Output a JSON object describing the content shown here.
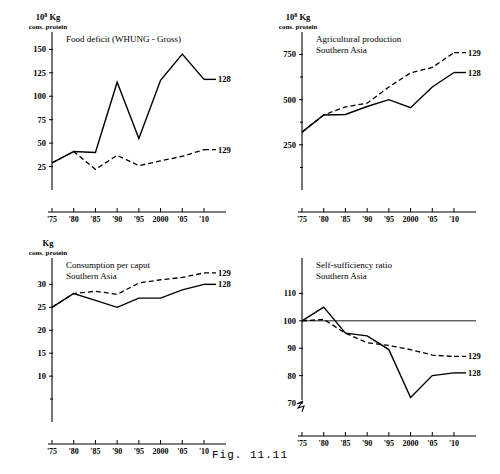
{
  "figure": {
    "caption": "Fig. 11.11"
  },
  "chart_data": [
    {
      "id": "food-deficit",
      "position": "top-left",
      "type": "line",
      "title": "Food deficit (WHUNG - Gross)",
      "subtitle": "",
      "ylabel_main": "Kg",
      "ylabel_exponent": "8",
      "ylabel_prefix": "10",
      "ylabel_sub": "cons. protein",
      "xlabel": "",
      "x": [
        "'75",
        "'80",
        "'85",
        "'90",
        "'95",
        "2000",
        "'05",
        "'10"
      ],
      "xtick_labels": [
        "'75",
        "'80",
        "'85",
        "'90",
        "'95",
        "2000",
        "'05",
        "'10"
      ],
      "ytick_labels": [
        "25",
        "50",
        "75",
        "100",
        "125",
        "150"
      ],
      "yticks": [
        25,
        50,
        75,
        100,
        125,
        150
      ],
      "yminor": [],
      "ylim": [
        0,
        160
      ],
      "grid": false,
      "reference_line": null,
      "axis_break": false,
      "series": [
        {
          "name": "128",
          "style": "solid",
          "label": "128",
          "values": [
            29,
            41,
            40,
            115,
            55,
            117,
            145,
            118
          ]
        },
        {
          "name": "129",
          "style": "dashed",
          "label": "129",
          "values": [
            29,
            41,
            22,
            37,
            26,
            31,
            36,
            43
          ]
        }
      ]
    },
    {
      "id": "agricultural-production",
      "position": "top-right",
      "type": "line",
      "title": "Agricultural production",
      "subtitle": "Southern Asia",
      "ylabel_main": "Kg",
      "ylabel_exponent": "8",
      "ylabel_prefix": "10",
      "ylabel_sub": "cons. protein",
      "xlabel": "",
      "x": [
        "'75",
        "'80",
        "'85",
        "'90",
        "'95",
        "2000",
        "'05",
        "'10"
      ],
      "xtick_labels": [
        "'75",
        "'80",
        "'85",
        "'90",
        "'95",
        "2000",
        "'05",
        "'10"
      ],
      "ytick_labels": [
        "250",
        "500",
        "750"
      ],
      "yticks": [
        250,
        500,
        750
      ],
      "yminor": [
        125,
        375,
        625
      ],
      "ylim": [
        0,
        830
      ],
      "grid": false,
      "reference_line": null,
      "axis_break": false,
      "series": [
        {
          "name": "128",
          "style": "solid",
          "label": "128",
          "values": [
            320,
            415,
            418,
            462,
            500,
            455,
            570,
            650
          ]
        },
        {
          "name": "129",
          "style": "dashed",
          "label": "129",
          "values": [
            320,
            415,
            460,
            480,
            570,
            648,
            678,
            760
          ]
        }
      ]
    },
    {
      "id": "consumption-per-caput",
      "position": "bottom-left",
      "type": "line",
      "title": "Consumption per caput",
      "subtitle": "Southern Asia",
      "ylabel_main": "Kg",
      "ylabel_exponent": "",
      "ylabel_prefix": "",
      "ylabel_sub": "cons. protein",
      "xlabel": "",
      "x": [
        "'75",
        "'80",
        "'85",
        "'90",
        "'95",
        "2000",
        "'05",
        "'10"
      ],
      "xtick_labels": [
        "'75",
        "'80",
        "'85",
        "'90",
        "'95",
        "2000",
        "'05",
        "'10"
      ],
      "ytick_labels": [
        "10",
        "15",
        "20",
        "25",
        "30"
      ],
      "yticks": [
        10,
        15,
        20,
        25,
        30
      ],
      "yminor": [
        5
      ],
      "ylim": [
        0,
        34
      ],
      "grid": false,
      "reference_line": null,
      "axis_break": false,
      "series": [
        {
          "name": "128",
          "style": "solid",
          "label": "128",
          "values": [
            25.0,
            28.0,
            26.5,
            25.0,
            27.0,
            27.0,
            28.8,
            30.0
          ]
        },
        {
          "name": "129",
          "style": "dashed",
          "label": "129",
          "values": [
            25.0,
            28.0,
            28.5,
            27.8,
            30.3,
            31.0,
            31.5,
            32.5
          ]
        }
      ]
    },
    {
      "id": "self-sufficiency-ratio",
      "position": "bottom-right",
      "type": "line",
      "title": "Self-sufficiency ratio",
      "subtitle": "Southern Asia",
      "ylabel_main": "",
      "ylabel_exponent": "",
      "ylabel_prefix": "",
      "ylabel_sub": "",
      "xlabel": "",
      "x": [
        "'75",
        "'80",
        "'85",
        "'90",
        "'95",
        "2000",
        "'05",
        "'10"
      ],
      "xtick_labels": [
        "'75",
        "'80",
        "'85",
        "'90",
        "'95",
        "2000",
        "'05",
        "'10"
      ],
      "ytick_labels": [
        "70",
        "80",
        "90",
        "100",
        "110"
      ],
      "yticks": [
        70,
        80,
        90,
        100,
        110
      ],
      "yminor": [],
      "ylim": [
        66,
        120
      ],
      "grid": false,
      "reference_line": 100,
      "axis_break": true,
      "series": [
        {
          "name": "128",
          "style": "solid",
          "label": "128",
          "values": [
            100,
            105,
            95.5,
            94.5,
            89.5,
            72,
            80,
            81
          ]
        },
        {
          "name": "129",
          "style": "dashed",
          "label": "129",
          "values": [
            100,
            100.5,
            95.5,
            92,
            91,
            89.5,
            87.5,
            87
          ]
        }
      ]
    }
  ]
}
